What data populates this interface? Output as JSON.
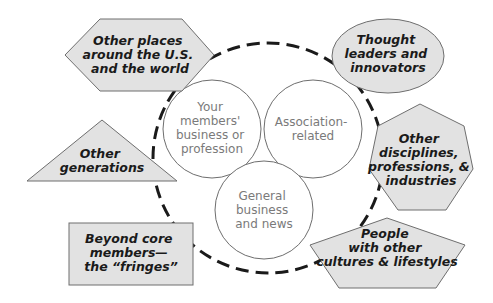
{
  "diagram": {
    "colors": {
      "outer_fill": "#e2e2e2",
      "outer_stroke": "#6e6e6e",
      "outer_text": "#1a1a1a",
      "inner_text": "#7a7a7a",
      "dashed_ring": "#1a1a1a"
    },
    "inner_circles": [
      {
        "lines": [
          "Your",
          "members'",
          "business or",
          "profession"
        ]
      },
      {
        "lines": [
          "Association-",
          "related"
        ]
      },
      {
        "lines": [
          "General",
          "business",
          "and news"
        ]
      }
    ],
    "outer_shapes": [
      {
        "shape": "hexagon",
        "lines": [
          "Other places",
          "around the U.S.",
          "and the world"
        ]
      },
      {
        "shape": "ellipse",
        "lines": [
          "Thought",
          "leaders and",
          "innovators"
        ]
      },
      {
        "shape": "triangle",
        "lines": [
          "Other",
          "generations"
        ]
      },
      {
        "shape": "heptagon",
        "lines": [
          "Other",
          "disciplines,",
          "professions, &",
          "industries"
        ]
      },
      {
        "shape": "rectangle",
        "lines": [
          "Beyond core",
          "members—",
          "the “fringes”"
        ]
      },
      {
        "shape": "pentagon",
        "lines": [
          "People",
          "with other",
          "cultures & lifestyles"
        ]
      }
    ]
  }
}
